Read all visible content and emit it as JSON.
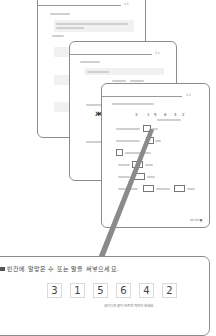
{
  "header": {
    "page_numbers": "3  1"
  },
  "front_card": {
    "digits": [
      "3",
      "1",
      "5",
      "6",
      "4",
      "2"
    ],
    "page_footer": "00 00  ■"
  },
  "zoom_card": {
    "instruction": "빈칸에 알맞은 수 또는 말을 써넣으세요.",
    "digits": [
      "3",
      "1",
      "5",
      "6",
      "4",
      "2"
    ],
    "note": "(보기)와 같이 바르게 짝지어 보세요."
  },
  "colors": {
    "border": "#8c8c8c",
    "connector": "#8a8a8a",
    "text": "#444444"
  }
}
